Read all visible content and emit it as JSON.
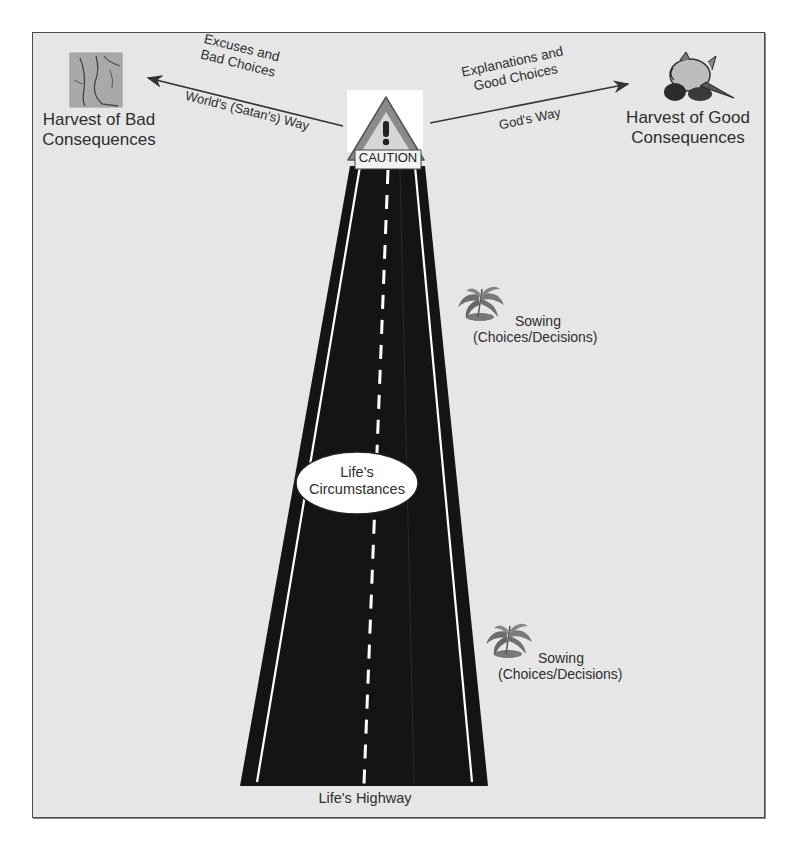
{
  "diagram": {
    "highway_label": "Life's Highway",
    "caution_sign": {
      "text": "CAUTION",
      "icon": "exclamation-warning-icon"
    },
    "center_ellipse": {
      "line1": "Life's",
      "line2": "Circumstances"
    },
    "left_path": {
      "arrow_label_top_1": "Excuses and",
      "arrow_label_top_2": "Bad Choices",
      "arrow_label_bottom": "World's (Satan's) Way",
      "destination_1": "Harvest of Bad",
      "destination_2": "Consequences",
      "icon": "cracked-ground-icon"
    },
    "right_path": {
      "arrow_label_top_1": "Explanations and",
      "arrow_label_top_2": "Good Choices",
      "arrow_label_bottom": "God's Way",
      "destination_1": "Harvest of Good",
      "destination_2": "Consequences",
      "icon": "produce-harvest-icon"
    },
    "sowing": [
      {
        "line1": "Sowing",
        "line2": "(Choices/Decisions)",
        "icon": "plant-icon"
      },
      {
        "line1": "Sowing",
        "line2": "(Choices/Decisions)",
        "icon": "plant-icon"
      }
    ],
    "colors": {
      "background": "#e6e6e6",
      "road": "#111111",
      "lane_lines": "#ffffff",
      "text": "#2e2e2e",
      "caution_triangle": "#8a8a8a"
    }
  }
}
